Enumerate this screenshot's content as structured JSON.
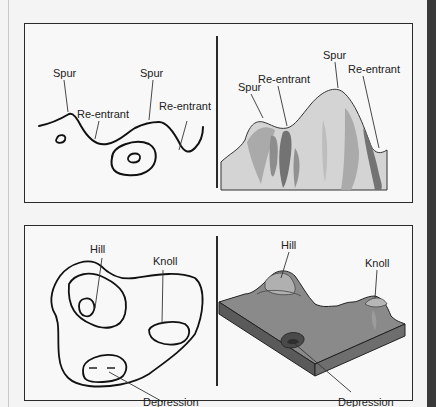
{
  "figure": {
    "top_panel": {
      "left_map": {
        "labels": {
          "spur_1": "Spur",
          "spur_2": "Spur",
          "reentrant_1": "Re-entrant",
          "reentrant_2": "Re-entrant"
        }
      },
      "right_relief": {
        "labels": {
          "spur_1": "Spur",
          "spur_2": "Spur",
          "reentrant_1": "Re-entrant",
          "reentrant_2": "Re-entrant"
        }
      }
    },
    "bottom_panel": {
      "left_map": {
        "labels": {
          "hill": "Hill",
          "knoll": "Knoll",
          "depression": "Depression"
        }
      },
      "right_relief": {
        "labels": {
          "hill": "Hill",
          "knoll": "Knoll",
          "depression": "Depression"
        }
      }
    },
    "colors": {
      "background": "#f4f4f4",
      "panel_bg": "#f8f8f8",
      "border": "#2a2a2a",
      "terrain_light": "#d4d4d4",
      "terrain_mid": "#a8a8a8",
      "terrain_dark": "#6e6e6e",
      "right_bar": "#3a3a3a"
    }
  }
}
